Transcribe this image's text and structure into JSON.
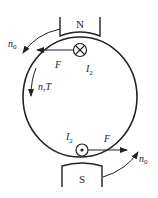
{
  "diagram": {
    "title": "",
    "colors": {
      "stroke": "#222222",
      "background": "#ffffff"
    },
    "magnets": {
      "north": {
        "label": "N"
      },
      "south": {
        "label": "S"
      }
    },
    "conductors": {
      "top": {
        "symbol": "into-page",
        "current_label": "I",
        "current_sub": "2",
        "force_label": "F"
      },
      "bottom": {
        "symbol": "out-of-page",
        "current_label": "I",
        "current_sub": "2",
        "force_label": "F"
      }
    },
    "rotation": {
      "field_top": {
        "label": "n",
        "sub": "0"
      },
      "field_bottom": {
        "label": "n",
        "sub": "0"
      },
      "rotor": {
        "label": "n,T"
      }
    }
  }
}
